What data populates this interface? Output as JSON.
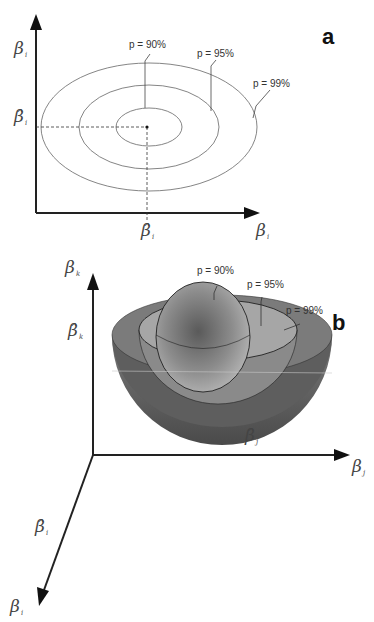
{
  "panel_a": {
    "label": "a",
    "y_axis": {
      "symbol": "β",
      "subscript": "i"
    },
    "y_estimate": {
      "symbol": "β̂",
      "subscript": "i"
    },
    "x_axis": {
      "symbol": "β",
      "subscript": "i"
    },
    "x_estimate": {
      "symbol": "β̂",
      "subscript": "i"
    },
    "contours": [
      {
        "label": "p = 90%"
      },
      {
        "label": "p = 95%"
      },
      {
        "label": "p = 99%"
      }
    ]
  },
  "panel_b": {
    "label": "b",
    "z_axis": {
      "symbol": "β",
      "subscript": "k"
    },
    "z_estimate": {
      "symbol": "β̂",
      "subscript": "k"
    },
    "x_axis": {
      "symbol": "β",
      "subscript": "j"
    },
    "x_estimate": {
      "symbol": "β̂",
      "subscript": "j"
    },
    "depth_axis": {
      "symbol": "β",
      "subscript": "i"
    },
    "depth_estimate": {
      "symbol": "β̂",
      "subscript": "i"
    },
    "shells": [
      {
        "label": "p = 90%"
      },
      {
        "label": "p = 95%"
      },
      {
        "label": "p = 99%"
      }
    ]
  },
  "colors": {
    "axis": "#222222",
    "contour": "#555555",
    "shell_outer": "#6e6e6e",
    "shell_mid": "#9a9a9a",
    "shell_inner": "#b0b0b0"
  }
}
